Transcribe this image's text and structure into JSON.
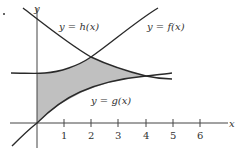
{
  "diagram": {
    "axes": {
      "x_label": "x",
      "y_label": "y"
    },
    "x_ticks": [
      "1",
      "2",
      "3",
      "4",
      "5",
      "6"
    ],
    "curves": [
      {
        "name": "h",
        "label": "y = h(x)",
        "description": "decreasing curve from top-left, crosses f at x≈2"
      },
      {
        "name": "f",
        "label": "y = f(x)",
        "description": "increasing curve, crosses h at x≈2, continues up-right"
      },
      {
        "name": "g",
        "label": "y = g(x)",
        "description": "increasing concave curve through origin, meets h at x≈4"
      }
    ],
    "shaded_region": "area between x=0, upper boundary min(f,h), and lower boundary g, from x=0 to x≈4",
    "colors": {
      "shade": "#c0c0c0",
      "curve": "#2a2a2a",
      "axis": "#444444"
    }
  }
}
